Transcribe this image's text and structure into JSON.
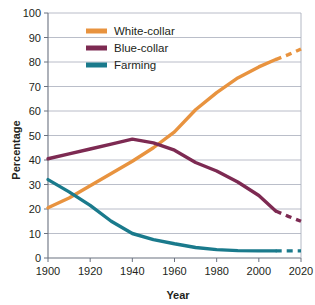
{
  "chart_data": {
    "type": "line",
    "title": "",
    "xlabel": "Year",
    "ylabel": "Percentage",
    "xlim": [
      1900,
      2020
    ],
    "ylim": [
      0,
      100
    ],
    "xticks": [
      1900,
      1920,
      1940,
      1960,
      1980,
      2000,
      2020
    ],
    "yticks": [
      0,
      10,
      20,
      30,
      40,
      50,
      60,
      70,
      80,
      90,
      100
    ],
    "grid": "horizontal",
    "legend_position": "top-left",
    "x": [
      1900,
      1910,
      1920,
      1930,
      1940,
      1950,
      1960,
      1970,
      1980,
      1990,
      2000,
      2008,
      2014,
      2020
    ],
    "series": [
      {
        "name": "White-collar",
        "color": "#E8933F",
        "values": [
          20.5,
          24.5,
          29.5,
          34.5,
          39.5,
          45.0,
          51.5,
          60.5,
          67.5,
          73.5,
          78.0,
          81.0,
          83.0,
          85.3
        ],
        "solid_until": 2008,
        "dashed_from": 2008
      },
      {
        "name": "Blue-collar",
        "color": "#7D2A52",
        "values": [
          40.5,
          42.5,
          44.5,
          46.5,
          48.5,
          47.0,
          44.0,
          39.0,
          35.5,
          31.0,
          25.5,
          19.2,
          17.0,
          15.0
        ],
        "solid_until": 2008,
        "dashed_from": 2008
      },
      {
        "name": "Farming",
        "color": "#1A7A8C",
        "values": [
          32.0,
          27.0,
          21.5,
          15.0,
          10.0,
          7.5,
          5.8,
          4.3,
          3.4,
          3.0,
          2.9,
          2.9,
          2.9,
          2.9
        ],
        "solid_until": 2008,
        "dashed_from": 2008
      }
    ]
  },
  "axes": {
    "y_label": "Percentage",
    "x_label": "Year",
    "y_tick_labels": [
      "100",
      "90",
      "80",
      "70",
      "60",
      "50",
      "40",
      "30",
      "20",
      "10",
      "0"
    ],
    "x_tick_labels": [
      "1900",
      "1920",
      "1940",
      "1960",
      "1980",
      "2000",
      "2020"
    ]
  },
  "legend": {
    "items": [
      {
        "label": "White-collar",
        "color": "#E8933F"
      },
      {
        "label": "Blue-collar",
        "color": "#7D2A52"
      },
      {
        "label": "Farming",
        "color": "#1A7A8C"
      }
    ]
  },
  "colors": {
    "white_collar": "#E8933F",
    "blue_collar": "#7D2A52",
    "farming": "#1A7A8C",
    "grid": "#9aa0b0",
    "axis": "#6b7280",
    "text": "#231f20",
    "background": "#ffffff"
  }
}
